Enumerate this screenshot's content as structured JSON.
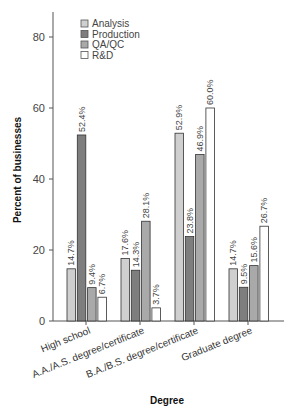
{
  "chart_data": {
    "type": "bar",
    "title": "",
    "xlabel": "Degree",
    "ylabel": "Percent of businesses",
    "ylim": [
      0,
      86
    ],
    "yticks": [
      0,
      20,
      40,
      60,
      80
    ],
    "grid": false,
    "legend_position": "top-left inside",
    "categories": [
      "High school",
      "A.A./A.S. degree/certificate",
      "B.A./B.S. degree/certificate",
      "Graduate degree"
    ],
    "series": [
      {
        "name": "Analysis",
        "color": "#cfcfcf",
        "values": [
          14.7,
          17.6,
          52.9,
          14.7
        ],
        "labels": [
          "14.7%",
          "17.6%",
          "52.9%",
          "14.7%"
        ]
      },
      {
        "name": "Production",
        "color": "#7e7e7e",
        "values": [
          52.4,
          14.3,
          23.8,
          9.5
        ],
        "labels": [
          "52.4%",
          "14.3%",
          "23.8%",
          "9.5%"
        ]
      },
      {
        "name": "QA/QC",
        "color": "#a9a9a9",
        "values": [
          9.4,
          28.1,
          46.9,
          15.6
        ],
        "labels": [
          "9.4%",
          "28.1%",
          "46.9%",
          "15.6%"
        ]
      },
      {
        "name": "R&D",
        "color": "#ffffff",
        "values": [
          6.7,
          3.7,
          60.0,
          26.7
        ],
        "labels": [
          "6.7%",
          "3.7%",
          "60.0%",
          "26.7%"
        ]
      }
    ]
  }
}
